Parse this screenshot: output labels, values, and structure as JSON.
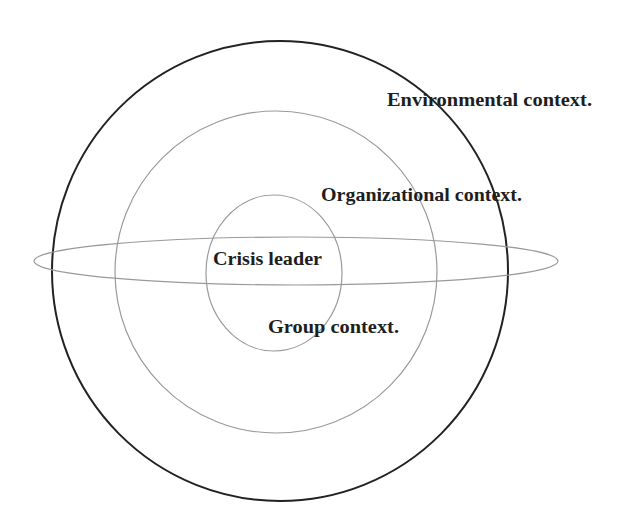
{
  "diagram": {
    "colors": {
      "background": "#ffffff",
      "outer_stroke": "#222222",
      "inner_stroke": "#9a9a9a",
      "text": "#1e1e1e"
    },
    "shapes": {
      "environmental": {
        "cx": 280,
        "cy": 271,
        "rx": 228,
        "ry": 230
      },
      "organizational": {
        "cx": 276,
        "cy": 272,
        "rx": 161,
        "ry": 161
      },
      "group": {
        "cx": 274,
        "cy": 273,
        "rx": 68,
        "ry": 78
      },
      "leader_band": {
        "cx": 296,
        "cy": 261,
        "rx": 262,
        "ry": 24
      }
    },
    "labels": {
      "environmental": "Environmental context.",
      "organizational": "Organizational context.",
      "leader": "Crisis leader",
      "group": "Group context."
    }
  }
}
